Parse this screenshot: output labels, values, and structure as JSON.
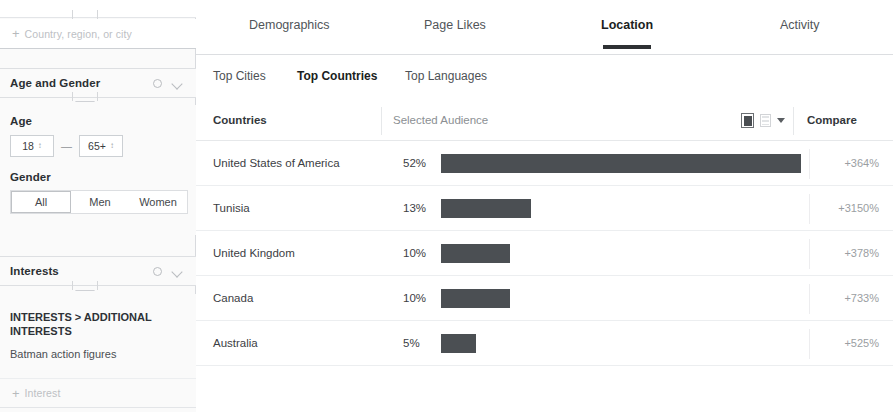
{
  "sidebar": {
    "location_field": {
      "placeholder": "Country, region, or city",
      "plus": "+"
    },
    "age_gender": {
      "title": "Age and Gender",
      "gear_icon": "gear-icon",
      "chevron_icon": "chevron-down-icon",
      "age_label": "Age",
      "age_min": "18",
      "age_max": "65+",
      "dash": "—",
      "gender_label": "Gender",
      "gender_options": [
        "All",
        "Men",
        "Women"
      ],
      "gender_selected": "All"
    },
    "interests": {
      "title": "Interests",
      "gear_icon": "gear-icon",
      "chevron_icon": "chevron-down-icon",
      "breadcrumb": "INTERESTS > ADDITIONAL INTERESTS",
      "items": [
        "Batman action figures"
      ],
      "add_placeholder": "Interest",
      "plus": "+"
    }
  },
  "main": {
    "tabs": [
      {
        "label": "Demographics",
        "active": false
      },
      {
        "label": "Page Likes",
        "active": false
      },
      {
        "label": "Location",
        "active": true
      },
      {
        "label": "Activity",
        "active": false
      }
    ],
    "subtabs": [
      {
        "label": "Top Cities",
        "active": false
      },
      {
        "label": "Top Countries",
        "active": true
      },
      {
        "label": "Top Languages",
        "active": false
      }
    ],
    "table_header": {
      "countries": "Countries",
      "audience": "Selected Audience",
      "compare": "Compare",
      "icons": [
        "bar-chart-icon",
        "table-icon",
        "chevron-down-icon"
      ]
    }
  },
  "chart_data": {
    "type": "bar",
    "title": "Top Countries",
    "xlabel": "Selected Audience",
    "ylabel": "Countries",
    "orientation": "horizontal",
    "grid": false,
    "legend": null,
    "xlim": [
      0,
      60
    ],
    "categories": [
      "United States of America",
      "Tunisia",
      "United Kingdom",
      "Canada",
      "Australia"
    ],
    "values": [
      52,
      13,
      10,
      10,
      5
    ],
    "value_labels": [
      "52%",
      "13%",
      "10%",
      "10%",
      "5%"
    ],
    "series": [
      {
        "name": "Selected Audience",
        "values": [
          52,
          13,
          10,
          10,
          5
        ]
      },
      {
        "name": "Compare",
        "values": [
          364,
          3150,
          378,
          733,
          525
        ]
      }
    ],
    "compare_labels": [
      "+364%",
      "+3150%",
      "+378%",
      "+733%",
      "+525%"
    ],
    "bar_color": "#4b4f53"
  }
}
